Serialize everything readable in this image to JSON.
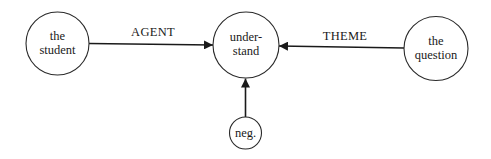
{
  "diagram": {
    "type": "conceptual graph",
    "nodes": [
      {
        "id": "student",
        "lines": [
          "the",
          "student"
        ]
      },
      {
        "id": "understand",
        "lines": [
          "under-",
          "stand"
        ]
      },
      {
        "id": "question",
        "lines": [
          "the",
          "question"
        ]
      },
      {
        "id": "neg",
        "lines": [
          "neg."
        ]
      }
    ],
    "edges": [
      {
        "from": "student",
        "to": "understand",
        "label": "AGENT"
      },
      {
        "from": "question",
        "to": "understand",
        "label": "THEME"
      },
      {
        "from": "neg",
        "to": "understand",
        "label": ""
      }
    ],
    "colors": {
      "stroke": "#1a1a1a",
      "background": "#ffffff"
    }
  }
}
